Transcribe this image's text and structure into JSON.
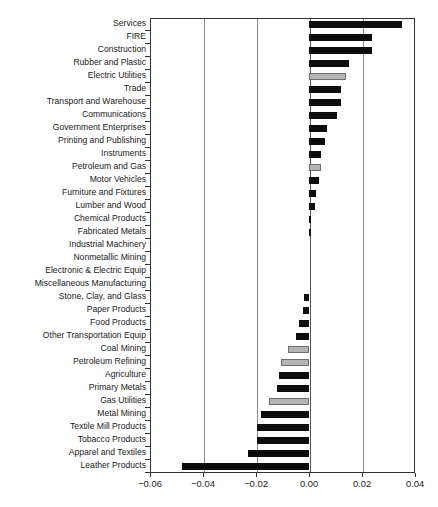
{
  "chart_data": {
    "type": "bar",
    "orientation": "horizontal",
    "title": "",
    "xlabel": "",
    "ylabel": "",
    "xlim": [
      -0.06,
      0.04
    ],
    "grid": true,
    "legend": null,
    "xticks": [
      "-0.06",
      "-0.02",
      "0.00",
      "0.02",
      "0.04"
    ],
    "xtick_values": [
      -0.06,
      -0.04,
      -0.02,
      0.0,
      0.02,
      0.04
    ],
    "xtick_labels": [
      "-0.06",
      "-0.04",
      "-0.02",
      "0.00",
      "0.02",
      "0.04"
    ],
    "categories": [
      "Services",
      "FIRE",
      "Construction",
      "Rubber and Plastic",
      "Electric Utilities",
      "Trade",
      "Transport and Warehouse",
      "Communications",
      "Government Enterprises",
      "Printing and Publishing",
      "Instruments",
      "Petroleum and Gas",
      "Motor Vehicles",
      "Furniture and Fixtures",
      "Lumber and Wood",
      "Chemical Products",
      "Fabricated Metals",
      "Industrial Machinery",
      "Nonmetallic Mining",
      "Electronic & Electric Equip",
      "Miscellaneous Manufacturing",
      "Stone, Clay, and Glass",
      "Paper Products",
      "Food Products",
      "Other Transportation Equip",
      "Coal Mining",
      "Petroleum Refining",
      "Agriculture",
      "Primary Metals",
      "Gas Utilities",
      "Metal Mining",
      "Textile Mill Products",
      "Tobacco Products",
      "Apparel and Textiles",
      "Leather Products"
    ],
    "values": [
      0.035,
      0.0236,
      0.0236,
      0.015,
      0.014,
      0.0122,
      0.0122,
      0.0104,
      0.0068,
      0.006,
      0.0046,
      0.0044,
      0.0038,
      0.0026,
      0.0022,
      0.0008,
      0.0001,
      0.0,
      0.0,
      0.0,
      0.0,
      -0.002,
      -0.0024,
      -0.0036,
      -0.0048,
      -0.0078,
      -0.0104,
      -0.0114,
      -0.0122,
      -0.015,
      -0.0182,
      -0.0196,
      -0.0198,
      -0.023,
      -0.048
    ],
    "colors": [
      "black",
      "black",
      "black",
      "black",
      "gray",
      "black",
      "black",
      "black",
      "black",
      "black",
      "black",
      "gray",
      "black",
      "black",
      "black",
      "black",
      "black",
      "black",
      "black",
      "black",
      "black",
      "black",
      "black",
      "black",
      "black",
      "gray",
      "gray",
      "black",
      "black",
      "gray",
      "black",
      "black",
      "black",
      "black",
      "black"
    ],
    "palette": {
      "black": "#0d0d0d",
      "gray": "#b4b4b4",
      "gray_edge": "#6e6e6e"
    }
  }
}
